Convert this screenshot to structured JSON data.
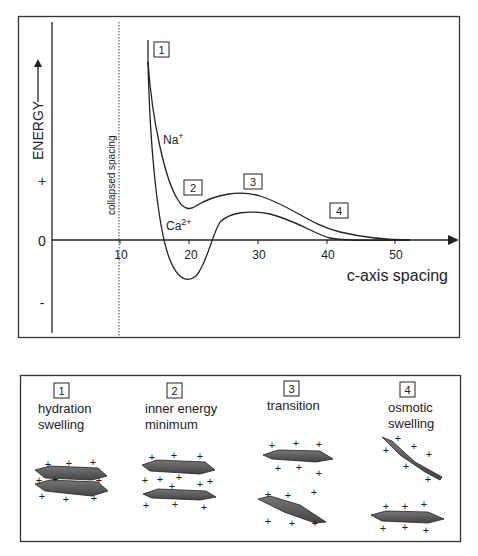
{
  "energy_plot": {
    "y_axis_label": "ENERGY",
    "y_ticks": {
      "plus": "+",
      "zero": "0",
      "minus": "-"
    },
    "x_axis_label": "c-axis spacing",
    "x_ticks": [
      "10",
      "20",
      "30",
      "40",
      "50"
    ],
    "collapsed_label": "collapsed spacing",
    "curves": [
      {
        "name": "Na+",
        "label_main": "Na",
        "label_sup": "+"
      },
      {
        "name": "Ca2+",
        "label_main": "Ca",
        "label_sup": "2+"
      }
    ],
    "markers": [
      "1",
      "2",
      "3",
      "4"
    ]
  },
  "stages": [
    {
      "num": "1",
      "line1": "hydration",
      "line2": "swelling"
    },
    {
      "num": "2",
      "line1": "inner energy",
      "line2": "minimum"
    },
    {
      "num": "3",
      "line1": "transition",
      "line2": ""
    },
    {
      "num": "4",
      "line1": "osmotic",
      "line2": "swelling"
    }
  ]
}
